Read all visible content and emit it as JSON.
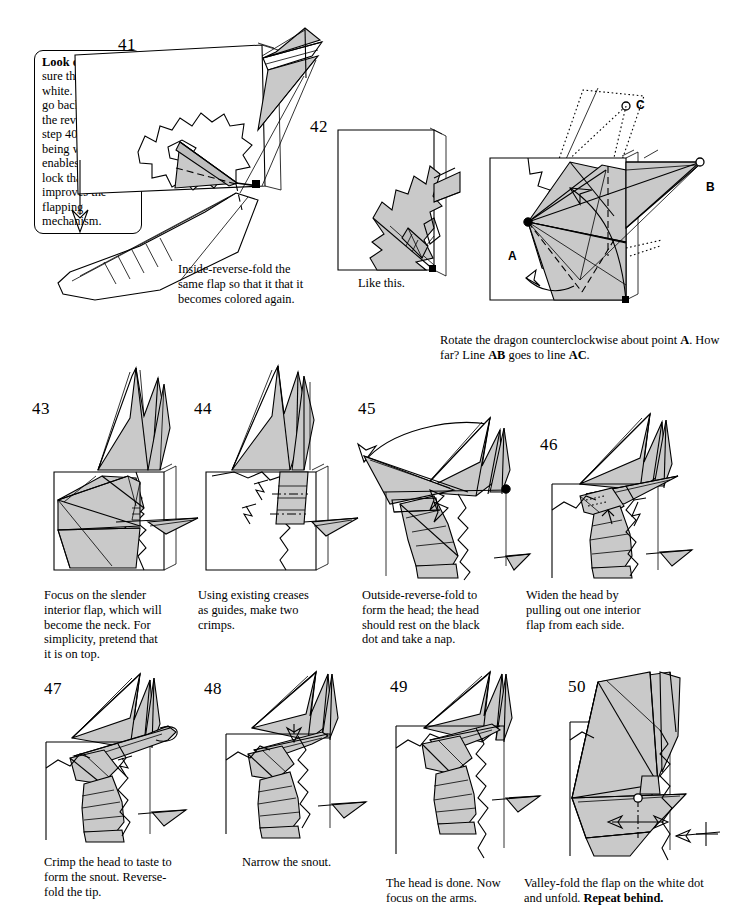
{
  "document": {
    "type": "origami-instruction-sheet",
    "subject": "flapping dragon",
    "colors": {
      "paper_colored": "#c9c9c9",
      "paper_white": "#ffffff",
      "ink": "#000000"
    }
  },
  "callout": {
    "heading": "Look out!",
    "body": "Make sure the flap is white.  If it isn’t, go back and redo the reverse fold in step 40. The flap being white enables a special lock that improves the flapping mechanism."
  },
  "steps": [
    {
      "number": "41",
      "caption": "Inside-reverse-fold the same flap so that it that it becomes colored again."
    },
    {
      "number": "42",
      "caption": "Like this."
    },
    {
      "number": "43",
      "caption": "Rotate the dragon counterclockwise about point A.  How far?  Line AB goes to line AC.",
      "caption_parts": [
        {
          "text": "Rotate the dragon counterclockwise about point ",
          "bold": false
        },
        {
          "text": "A",
          "bold": true
        },
        {
          "text": ".  How far?  Line ",
          "bold": false
        },
        {
          "text": "AB",
          "bold": true
        },
        {
          "text": " goes to line ",
          "bold": false
        },
        {
          "text": "AC",
          "bold": true
        },
        {
          "text": ".",
          "bold": false
        }
      ],
      "point_labels": [
        "A",
        "B",
        "C"
      ]
    },
    {
      "number": "43",
      "caption": "Focus on the slender interior flap, which will become the neck.  For simplicity, pretend that it is on top."
    },
    {
      "number": "44",
      "caption": "Using existing creases as guides, make two crimps."
    },
    {
      "number": "45",
      "caption": "Outside-reverse-fold to form the head; the head should rest on the black dot and take a nap."
    },
    {
      "number": "46",
      "caption": "Widen the head by pulling out one interior flap from each side."
    },
    {
      "number": "47",
      "caption": "Crimp the head to taste to form the snout. Reverse-fold the tip."
    },
    {
      "number": "48",
      "caption": "Narrow the snout."
    },
    {
      "number": "49",
      "caption": "The head is done. Now focus on the arms."
    },
    {
      "number": "50",
      "caption": "Valley-fold the flap on the white dot and unfold. Repeat behind.",
      "caption_parts": [
        {
          "text": "Valley-fold the flap on the white dot and unfold. ",
          "bold": false
        },
        {
          "text": "Repeat behind.",
          "bold": true
        }
      ]
    }
  ]
}
